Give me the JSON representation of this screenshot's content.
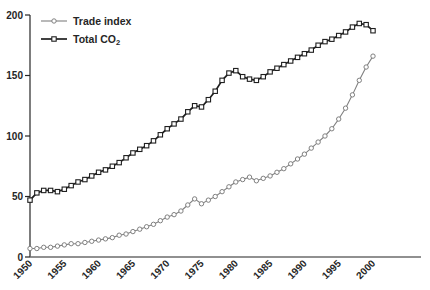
{
  "figure": {
    "background": "#ffffff",
    "text_color": "#262626",
    "y_axis_color": "#262626",
    "x_axis_color": "#6b6b6b"
  },
  "chart_data": {
    "type": "line",
    "title": "",
    "xlabel": "",
    "ylabel": "",
    "grid": false,
    "legend_position": "top-left",
    "ylim": [
      0,
      200
    ],
    "yticks": [
      0,
      50,
      100,
      150,
      200
    ],
    "xticks": [
      1950,
      1955,
      1960,
      1965,
      1970,
      1975,
      1980,
      1985,
      1990,
      1995,
      2000
    ],
    "xtick_rotation": 45,
    "x": [
      1950,
      1951,
      1952,
      1953,
      1954,
      1955,
      1956,
      1957,
      1958,
      1959,
      1960,
      1961,
      1962,
      1963,
      1964,
      1965,
      1966,
      1967,
      1968,
      1969,
      1970,
      1971,
      1972,
      1973,
      1974,
      1975,
      1976,
      1977,
      1978,
      1979,
      1980,
      1981,
      1982,
      1983,
      1984,
      1985,
      1986,
      1987,
      1988,
      1989,
      1990,
      1991,
      1992,
      1993,
      1994,
      1995,
      1996,
      1997,
      1998,
      1999,
      2000
    ],
    "series": [
      {
        "id": "trade-index-series",
        "name": "Trade index",
        "name_main": "Trade index",
        "name_sub": "",
        "marker": "circle",
        "color": "#808080",
        "line_width": 1.1,
        "values": [
          7,
          7,
          8,
          8,
          9,
          10,
          11,
          11,
          12,
          13,
          14,
          15,
          16,
          18,
          19,
          21,
          23,
          25,
          27,
          30,
          33,
          35,
          38,
          43,
          48,
          44,
          47,
          50,
          54,
          58,
          62,
          64,
          66,
          63,
          65,
          67,
          70,
          73,
          77,
          81,
          85,
          90,
          95,
          100,
          106,
          114,
          123,
          134,
          146,
          157,
          166
        ]
      },
      {
        "id": "total-co2-series",
        "name": "Total CO2",
        "name_main": "Total CO",
        "name_sub": "2",
        "marker": "square",
        "color": "#1f1f1f",
        "line_width": 1.7,
        "values": [
          47,
          53,
          55,
          55,
          54,
          56,
          59,
          62,
          64,
          67,
          70,
          72,
          75,
          78,
          82,
          86,
          89,
          92,
          96,
          101,
          106,
          110,
          114,
          120,
          125,
          124,
          130,
          137,
          146,
          152,
          154,
          149,
          147,
          146,
          149,
          153,
          156,
          159,
          162,
          165,
          168,
          171,
          175,
          178,
          180,
          183,
          186,
          190,
          193,
          192,
          187
        ]
      }
    ]
  }
}
